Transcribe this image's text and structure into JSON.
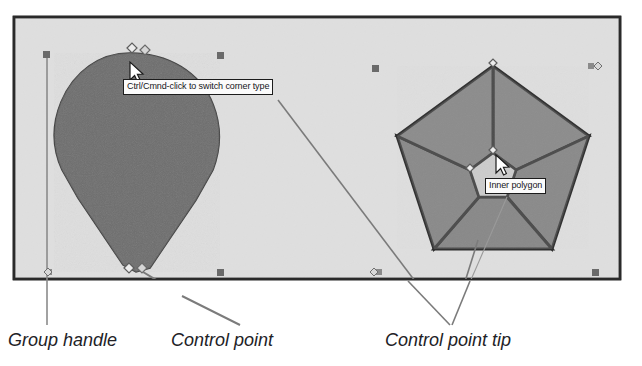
{
  "figure": {
    "canvas": {
      "background_color": "#e7e7e7",
      "border_color": "#2a2a2a",
      "page_background": "#ffffff"
    }
  },
  "tooltips": [
    {
      "id": "corner-type",
      "text": "Ctrl/Cmnd-click to switch corner type",
      "background_color": "#fbfbfb",
      "border_color": "#1c1c1c",
      "text_color": "#15151a"
    },
    {
      "id": "inner-polygon",
      "text": "Inner polygon",
      "background_color": "#fbfbfb",
      "border_color": "#1c1c1c",
      "text_color": "#15151a"
    }
  ],
  "captions": [
    {
      "id": "group-handle",
      "text": "Group handle"
    },
    {
      "id": "control-point",
      "text": "Control point"
    },
    {
      "id": "control-point-tip",
      "text": "Control point tip"
    }
  ],
  "shapes": {
    "teardrop": {
      "name": "teardrop-shape",
      "fill_color": "#6e6e6e",
      "stroke_color": "#3a3a3a"
    },
    "pentagon_ring": {
      "name": "pentagon-ring-shape",
      "fill_color": "#8b8b8b",
      "stroke_color": "#2f2f2f",
      "inner_hole_color": "#e9e9e9",
      "segment_count": 5
    }
  },
  "handles": {
    "group_handle_color": "#6a6a6a",
    "control_point_fill": "#e8e8e8",
    "control_point_stroke": "#5a5a5a",
    "leader_line_color": "#7b7b7b",
    "count_square_handles": 8,
    "count_control_points": 6
  },
  "cursors": [
    {
      "id": "cursor-teardrop-top",
      "type": "arrow-pointer"
    },
    {
      "id": "cursor-pentagon-center",
      "type": "arrow-pointer"
    }
  ]
}
